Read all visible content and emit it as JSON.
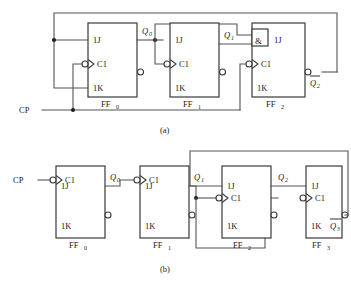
{
  "figure": {
    "captions": [
      {
        "id": "caption-a",
        "text": "(a)"
      },
      {
        "id": "caption-b",
        "text": "(b)"
      }
    ],
    "colors": {
      "wire": "#555555",
      "box_stroke": "#3a3a3a",
      "text": "#1a1a1a",
      "background": "#ffffff"
    }
  },
  "diagram_a": {
    "caption": "(a)",
    "clock_label": "CP",
    "flipflops": [
      {
        "name": "FF",
        "subscript": "0",
        "pins": {
          "j": "1J",
          "clk": "C1",
          "k": "1K"
        }
      },
      {
        "name": "FF",
        "subscript": "1",
        "pins": {
          "j": "1J",
          "clk": "C1",
          "k": "1K"
        }
      },
      {
        "name": "FF",
        "subscript": "2",
        "pins": {
          "j": "1J",
          "clk": "C1",
          "k": "1K"
        },
        "and_gate_label": "&"
      }
    ],
    "signals": [
      {
        "id": "q0",
        "base": "Q",
        "subscript": "0",
        "overbar": false
      },
      {
        "id": "q1",
        "base": "Q",
        "subscript": "1",
        "overbar": false
      },
      {
        "id": "q2bar",
        "base": "Q",
        "subscript": "2",
        "overbar": true
      }
    ]
  },
  "diagram_b": {
    "caption": "(b)",
    "clock_label": "CP",
    "flipflops": [
      {
        "name": "FF",
        "subscript": "0",
        "pins": {
          "j": "1J",
          "clk": "C1",
          "k": "1K"
        }
      },
      {
        "name": "FF",
        "subscript": "1",
        "pins": {
          "j": "1J",
          "clk": "C1",
          "k": "1K"
        }
      },
      {
        "name": "FF",
        "subscript": "2",
        "pins": {
          "j": "1J",
          "clk": "C1",
          "k": "1K"
        }
      },
      {
        "name": "FF",
        "subscript": "3",
        "pins": {
          "j": "1J",
          "clk": "C1",
          "k": "1K"
        }
      }
    ],
    "signals": [
      {
        "id": "q0",
        "base": "Q",
        "subscript": "0",
        "overbar": false
      },
      {
        "id": "q1",
        "base": "Q",
        "subscript": "1",
        "overbar": false
      },
      {
        "id": "q2",
        "base": "Q",
        "subscript": "2",
        "overbar": false
      },
      {
        "id": "q3bar",
        "base": "Q",
        "subscript": "3",
        "overbar": true
      }
    ]
  }
}
